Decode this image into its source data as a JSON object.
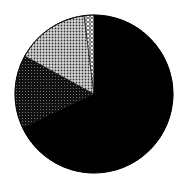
{
  "chart_data": {
    "type": "pie",
    "title": "",
    "labels": [
      "Slice A",
      "Slice B",
      "Slice C",
      "Slice D"
    ],
    "values": [
      68,
      15,
      15,
      2
    ],
    "start_angle_deg": 0,
    "direction": "clockwise",
    "fills": [
      "solid-black",
      "dark-gray-dotted",
      "light-gray-dotted",
      "white-dotted"
    ],
    "colors": [
      "#000000",
      "#2a2a2a",
      "#9a9a9a",
      "#e8e8e8"
    ],
    "legend": "none",
    "data_labels": "none"
  }
}
